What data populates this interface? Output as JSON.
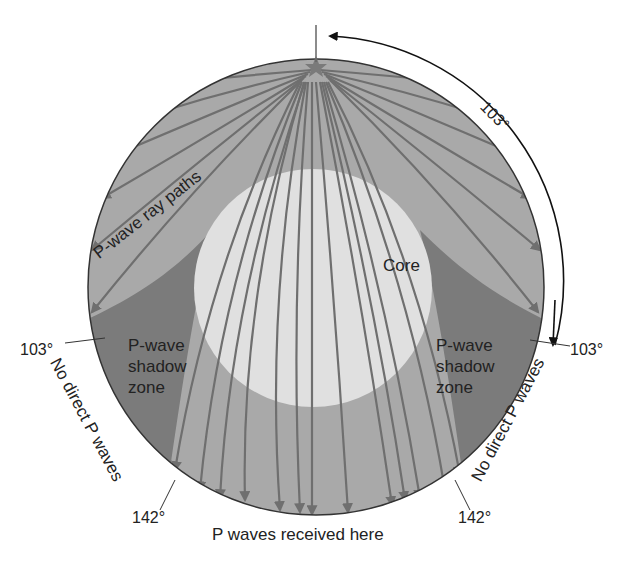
{
  "figure": {
    "title": "P-wave shadow zone",
    "colors": {
      "mantle": "#a9a9a9",
      "shadow_zone": "#7b7b7b",
      "core": "#e0e0e0",
      "ray": "#6f6f6f",
      "outline": "#333333"
    },
    "labels": {
      "ray_paths": "P-wave ray paths",
      "core": "Core",
      "shadow_left": [
        "P-wave",
        "shadow",
        "zone"
      ],
      "shadow_right": [
        "P-wave",
        "shadow",
        "zone"
      ],
      "no_direct_left": "No direct P waves",
      "no_direct_right": "No direct P waves",
      "received": "P waves received here",
      "angle_top_right": "103°",
      "angle_left_103": "103°",
      "angle_right_103": "103°",
      "angle_left_142": "142°",
      "angle_right_142": "142°"
    },
    "epicenter_icon": "star-icon"
  }
}
